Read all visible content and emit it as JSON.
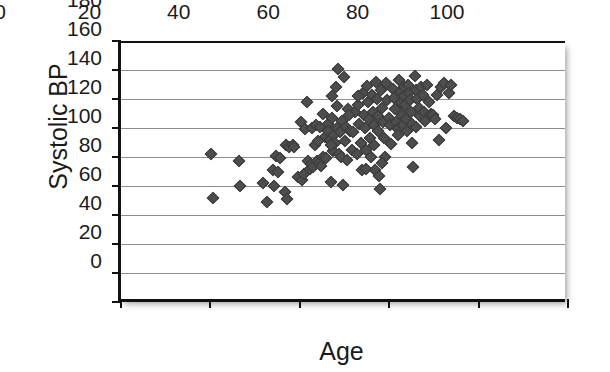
{
  "chart_data": {
    "type": "scatter",
    "title": "",
    "xlabel": "Age",
    "ylabel": "Systolic BP",
    "xlim": [
      0,
      100
    ],
    "ylim": [
      0,
      180
    ],
    "xticks": [
      0,
      20,
      40,
      60,
      80,
      100
    ],
    "yticks": [
      0,
      20,
      40,
      60,
      80,
      100,
      120,
      140,
      160,
      180
    ],
    "grid": "horizontal",
    "legend": "none",
    "marker": "diamond",
    "marker_color": "#4d4d4d",
    "axis_color": "#111111",
    "gridline_color": "#8e8e8e",
    "background": "#ffffff",
    "n_points": 151,
    "points": [
      [
        20.2,
        102
      ],
      [
        20.6,
        72
      ],
      [
        26.3,
        97
      ],
      [
        26.6,
        80
      ],
      [
        31.8,
        82
      ],
      [
        32.6,
        69
      ],
      [
        34.1,
        91
      ],
      [
        34.3,
        80
      ],
      [
        34.6,
        101
      ],
      [
        35.2,
        90
      ],
      [
        35.6,
        99
      ],
      [
        36.6,
        76
      ],
      [
        37.0,
        108
      ],
      [
        37.2,
        71
      ],
      [
        37.6,
        107
      ],
      [
        38.4,
        108
      ],
      [
        38.8,
        107
      ],
      [
        39.6,
        86
      ],
      [
        40.2,
        124
      ],
      [
        40.5,
        84
      ],
      [
        40.9,
        88
      ],
      [
        41.2,
        119
      ],
      [
        41.5,
        138
      ],
      [
        41.8,
        97
      ],
      [
        42.2,
        92
      ],
      [
        42.4,
        95
      ],
      [
        42.8,
        120
      ],
      [
        43.0,
        93
      ],
      [
        43.3,
        108
      ],
      [
        43.6,
        122
      ],
      [
        43.9,
        97
      ],
      [
        44.2,
        96
      ],
      [
        44.5,
        121
      ],
      [
        44.8,
        94
      ],
      [
        45.1,
        130
      ],
      [
        45.3,
        100
      ],
      [
        45.6,
        114
      ],
      [
        45.9,
        99
      ],
      [
        46.2,
        123
      ],
      [
        46.4,
        118
      ],
      [
        46.7,
        112
      ],
      [
        46.9,
        83
      ],
      [
        47.1,
        142
      ],
      [
        47.3,
        127
      ],
      [
        47.5,
        104
      ],
      [
        47.7,
        115
      ],
      [
        47.9,
        110
      ],
      [
        48.1,
        148
      ],
      [
        48.3,
        135
      ],
      [
        48.4,
        120
      ],
      [
        48.6,
        161
      ],
      [
        48.8,
        102
      ],
      [
        49.0,
        117
      ],
      [
        49.2,
        100
      ],
      [
        49.4,
        125
      ],
      [
        49.6,
        81
      ],
      [
        49.9,
        155
      ],
      [
        50.1,
        111
      ],
      [
        50.3,
        121
      ],
      [
        50.5,
        98
      ],
      [
        50.8,
        133
      ],
      [
        51.2,
        118
      ],
      [
        51.6,
        105
      ],
      [
        52.0,
        117
      ],
      [
        52.4,
        131
      ],
      [
        52.8,
        102
      ],
      [
        53.1,
        136
      ],
      [
        53.3,
        123
      ],
      [
        53.6,
        110
      ],
      [
        53.9,
        91
      ],
      [
        54.1,
        144
      ],
      [
        54.3,
        129
      ],
      [
        54.5,
        120
      ],
      [
        54.7,
        105
      ],
      [
        54.9,
        92
      ],
      [
        55.1,
        149
      ],
      [
        55.3,
        138
      ],
      [
        55.5,
        126
      ],
      [
        55.7,
        113
      ],
      [
        55.9,
        100
      ],
      [
        56.1,
        143
      ],
      [
        56.3,
        131
      ],
      [
        56.5,
        122
      ],
      [
        56.7,
        108
      ],
      [
        56.9,
        91
      ],
      [
        57.1,
        152
      ],
      [
        57.3,
        140
      ],
      [
        57.4,
        128
      ],
      [
        57.6,
        118
      ],
      [
        57.8,
        87
      ],
      [
        58.0,
        78
      ],
      [
        58.2,
        146
      ],
      [
        58.4,
        134
      ],
      [
        58.6,
        124
      ],
      [
        58.8,
        113
      ],
      [
        59.0,
        100
      ],
      [
        59.3,
        151
      ],
      [
        59.6,
        139
      ],
      [
        59.9,
        127
      ],
      [
        60.2,
        122
      ],
      [
        60.5,
        109
      ],
      [
        60.8,
        147
      ],
      [
        61.1,
        141
      ],
      [
        61.4,
        133
      ],
      [
        61.6,
        124
      ],
      [
        61.9,
        119
      ],
      [
        62.2,
        153
      ],
      [
        62.4,
        145
      ],
      [
        62.6,
        137
      ],
      [
        62.8,
        129
      ],
      [
        63.0,
        122
      ],
      [
        63.2,
        148
      ],
      [
        63.4,
        142
      ],
      [
        63.6,
        136
      ],
      [
        63.8,
        126
      ],
      [
        64.0,
        118
      ],
      [
        64.2,
        150
      ],
      [
        64.4,
        144
      ],
      [
        64.6,
        139
      ],
      [
        64.8,
        131
      ],
      [
        65.0,
        123
      ],
      [
        65.2,
        110
      ],
      [
        65.4,
        93
      ],
      [
        65.7,
        156
      ],
      [
        66.0,
        146
      ],
      [
        66.3,
        140
      ],
      [
        66.6,
        134
      ],
      [
        66.9,
        128
      ],
      [
        67.2,
        148
      ],
      [
        67.5,
        143
      ],
      [
        67.8,
        131
      ],
      [
        68.1,
        125
      ],
      [
        68.5,
        150
      ],
      [
        68.9,
        138
      ],
      [
        69.3,
        130
      ],
      [
        69.7,
        129
      ],
      [
        70.2,
        126
      ],
      [
        70.6,
        143
      ],
      [
        71.1,
        112
      ],
      [
        71.6,
        148
      ],
      [
        72.2,
        151
      ],
      [
        72.8,
        120
      ],
      [
        73.4,
        144
      ],
      [
        73.9,
        150
      ],
      [
        74.5,
        128
      ],
      [
        75.1,
        127
      ],
      [
        75.8,
        126
      ],
      [
        76.4,
        125
      ],
      [
        47.0,
        108
      ],
      [
        51.0,
        129
      ],
      [
        58.5,
        96
      ],
      [
        62.0,
        115
      ],
      [
        44.0,
        111
      ],
      [
        53.0,
        142
      ],
      [
        66.0,
        121
      ]
    ]
  }
}
